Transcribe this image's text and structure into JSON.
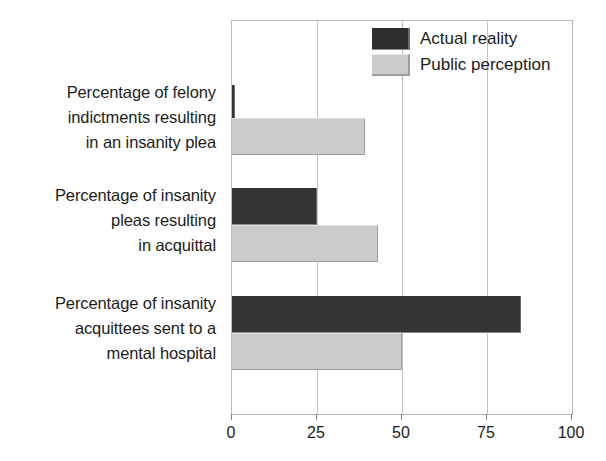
{
  "chart_data": {
    "type": "bar",
    "orientation": "horizontal",
    "title": "",
    "subtitle": "",
    "xlabel": "",
    "ylabel": "",
    "xlim": [
      0,
      100
    ],
    "xticks": [
      0,
      25,
      50,
      75,
      100
    ],
    "xtick_labels": [
      "0",
      "25",
      "50",
      "75",
      "100"
    ],
    "grid": true,
    "grid_axis": "x",
    "legend_position": "top-right",
    "categories": [
      "Percentage of felony indictments resulting in an insanity plea",
      "Percentage of insanity pleas resulting in acquittal",
      "Percentage of insanity acquittees sent to a mental hospital"
    ],
    "category_lines": [
      [
        "Percentage of felony",
        "indictments resulting",
        "in an insanity plea"
      ],
      [
        "Percentage of insanity",
        "pleas resulting",
        "in acquittal"
      ],
      [
        "Percentage of insanity",
        "acquittees sent to a",
        "mental hospital"
      ]
    ],
    "series": [
      {
        "name": "Actual reality",
        "color": "#343434",
        "values": [
          1,
          25,
          85
        ]
      },
      {
        "name": "Public perception",
        "color": "#cbcbcb",
        "values": [
          39,
          43,
          50
        ]
      }
    ]
  },
  "legend": {
    "entries": [
      {
        "label": "Actual reality",
        "swatch": "dark"
      },
      {
        "label": "Public perception",
        "swatch": "light"
      }
    ]
  },
  "axis": {
    "x_tick_labels": [
      "0",
      "25",
      "50",
      "75",
      "100"
    ]
  },
  "colors": {
    "actual_reality": "#343434",
    "public_perception": "#cbcbcb",
    "gridline": "#c3c3c3",
    "frame": "#b9b9b9",
    "text": "#1c1c1c",
    "background": "#ffffff"
  }
}
